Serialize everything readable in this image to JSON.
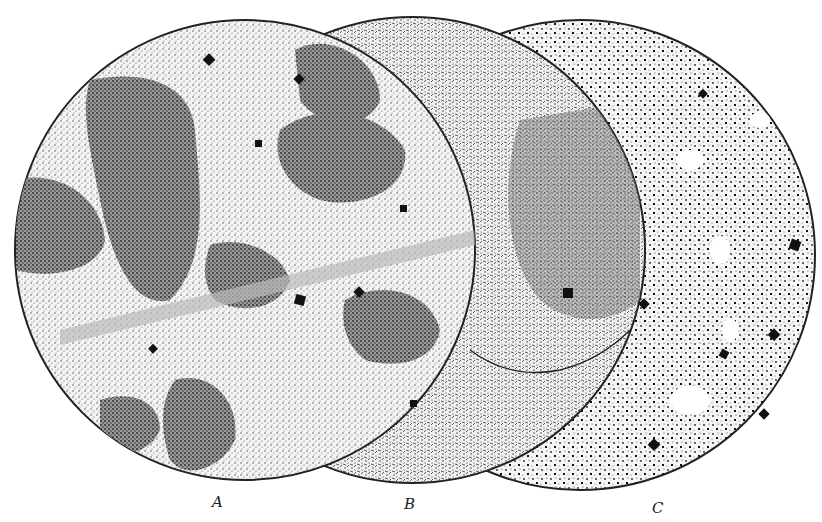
{
  "figure": {
    "panels": [
      {
        "id": "C",
        "label": "C",
        "cx": 580,
        "cy": 255,
        "r": 235,
        "label_x": 652,
        "label_y": 496
      },
      {
        "id": "B",
        "label": "B",
        "cx": 412,
        "cy": 250,
        "r": 233,
        "label_x": 404,
        "label_y": 492
      },
      {
        "id": "A",
        "label": "A",
        "cx": 245,
        "cy": 250,
        "r": 230,
        "label_x": 212,
        "label_y": 490
      }
    ]
  }
}
